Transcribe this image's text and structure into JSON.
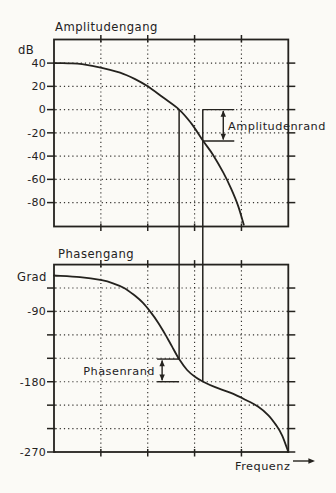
{
  "page": {
    "background_color": "#fbfaf6",
    "ink_color": "#24221e",
    "figure_type": "Bode diagram with gain margin and phase margin"
  },
  "chart_data": [
    {
      "id": "amplitude-response",
      "type": "line",
      "title": "Amplitudengang",
      "ylabel": "dB",
      "yticks": [
        40,
        20,
        0,
        -20,
        -40,
        -60,
        -80
      ],
      "ylim": [
        60,
        -100
      ],
      "grid": "dotted",
      "x_axis": {
        "scale": "log-frequency, unlabeled",
        "gridline_fracs": [
          0.2,
          0.4,
          0.6,
          0.8
        ]
      },
      "curve_points": [
        [
          0.0,
          40
        ],
        [
          0.06,
          39.8
        ],
        [
          0.12,
          39.1
        ],
        [
          0.204,
          36.0
        ],
        [
          0.282,
          31.7
        ],
        [
          0.346,
          26.2
        ],
        [
          0.4,
          20.0
        ],
        [
          0.466,
          10.3
        ],
        [
          0.534,
          0
        ],
        [
          0.585,
          -11.6
        ],
        [
          0.637,
          -27
        ],
        [
          0.679,
          -39
        ],
        [
          0.722,
          -54
        ],
        [
          0.756,
          -68
        ],
        [
          0.786,
          -83
        ],
        [
          0.81,
          -99
        ]
      ]
    },
    {
      "id": "phase-response",
      "type": "line",
      "title": "Phasengang",
      "ylabel": "Grad",
      "yticks": [
        -90,
        -180,
        -270
      ],
      "minor_ytick_step_deg": 30,
      "ylim": [
        -30,
        -270
      ],
      "grid": "dotted",
      "x_axis": {
        "scale": "log-frequency, unlabeled",
        "gridline_fracs": [
          0.2,
          0.4,
          0.6,
          0.8
        ]
      },
      "curve_points": [
        [
          0.0,
          -44
        ],
        [
          0.111,
          -46
        ],
        [
          0.204,
          -50
        ],
        [
          0.252,
          -54
        ],
        [
          0.299,
          -60
        ],
        [
          0.346,
          -70
        ],
        [
          0.38,
          -79
        ],
        [
          0.41,
          -90
        ],
        [
          0.444,
          -104
        ],
        [
          0.474,
          -119
        ],
        [
          0.504,
          -135
        ],
        [
          0.534,
          -151
        ],
        [
          0.568,
          -165
        ],
        [
          0.603,
          -174
        ],
        [
          0.637,
          -180
        ],
        [
          0.688,
          -187
        ],
        [
          0.752,
          -194
        ],
        [
          0.816,
          -203
        ],
        [
          0.872,
          -212
        ],
        [
          0.915,
          -223
        ],
        [
          0.949,
          -236
        ],
        [
          0.974,
          -249
        ],
        [
          1.0,
          -270
        ]
      ]
    }
  ],
  "annotations": {
    "gain_crossover_line": {
      "x_frac": 0.534
    },
    "phase_crossover_line": {
      "x_frac": 0.635
    },
    "gain_margin": {
      "label": "Amplitudenrand",
      "from_db": 0,
      "to_db": -27
    },
    "phase_margin": {
      "label": "Phasenrand",
      "from_deg": -151,
      "to_deg": -180
    },
    "x_axis_label": "Frequenz"
  }
}
